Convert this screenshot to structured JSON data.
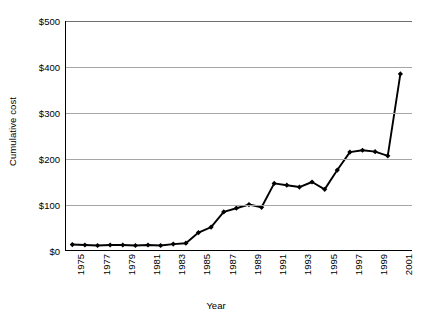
{
  "chart_data": {
    "type": "line",
    "title": "",
    "xlabel": "Year",
    "ylabel": "Cumulative cost",
    "xlim": [
      1974.5,
      2002
    ],
    "ylim": [
      0,
      500
    ],
    "ytick_values": [
      0,
      100,
      200,
      300,
      400,
      500
    ],
    "ytick_labels": [
      "$0",
      "$100",
      "$200",
      "$300",
      "$400",
      "$500"
    ],
    "xtick_labels": [
      "1975",
      "1977",
      "1979",
      "1981",
      "1983",
      "1985",
      "1987",
      "1989",
      "1991",
      "1993",
      "1995",
      "1997",
      "1999",
      "2001"
    ],
    "xtick_label_years": [
      1975,
      1977,
      1979,
      1981,
      1983,
      1985,
      1987,
      1989,
      1991,
      1993,
      1995,
      1997,
      1999,
      2001
    ],
    "minor_tick_years": [
      1975,
      1976,
      1977,
      1978,
      1979,
      1980,
      1981,
      1982,
      1983,
      1984,
      1985,
      1986,
      1987,
      1988,
      1989,
      1990,
      1991,
      1992,
      1993,
      1994,
      1995,
      1996,
      1997,
      1998,
      1999,
      2000,
      2001
    ],
    "grid": true,
    "legend": false,
    "marker": "diamond",
    "line_color": "#000000",
    "grid_color": "#a6a6a6",
    "x": [
      1975,
      1976,
      1977,
      1978,
      1979,
      1980,
      1981,
      1982,
      1983,
      1984,
      1985,
      1986,
      1987,
      1988,
      1989,
      1990,
      1991,
      1992,
      1993,
      1994,
      1995,
      1996,
      1997,
      1998,
      1999,
      2000,
      2001
    ],
    "values": [
      14,
      13,
      12,
      13,
      13,
      12,
      13,
      12,
      15,
      17,
      40,
      52,
      85,
      93,
      101,
      95,
      147,
      143,
      139,
      150,
      134,
      176,
      215,
      219,
      216,
      207,
      385
    ],
    "series": [
      {
        "name": "Cumulative cost",
        "values": [
          14,
          13,
          12,
          13,
          13,
          12,
          13,
          12,
          15,
          17,
          40,
          52,
          85,
          93,
          101,
          95,
          147,
          143,
          139,
          150,
          134,
          176,
          215,
          219,
          216,
          207,
          385
        ]
      }
    ]
  }
}
